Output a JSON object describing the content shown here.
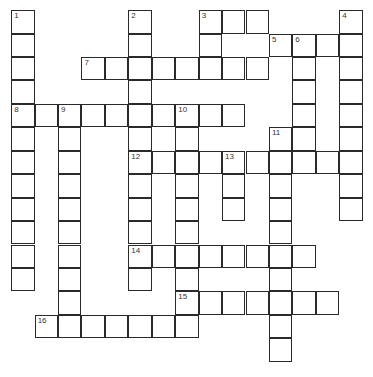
{
  "puzzle": {
    "rows": 15,
    "cols": 15,
    "cell_size": 23.43,
    "line_color": "#2a2a2a",
    "words": [
      {
        "number": 1,
        "direction": "down",
        "row": 0,
        "col": 0,
        "length": 12
      },
      {
        "number": 2,
        "direction": "down",
        "row": 0,
        "col": 5,
        "length": 12
      },
      {
        "number": 3,
        "direction": "across",
        "row": 0,
        "col": 8,
        "length": 3
      },
      {
        "number": 3,
        "direction": "down",
        "row": 0,
        "col": 8,
        "length": 3
      },
      {
        "number": 4,
        "direction": "down",
        "row": 0,
        "col": 14,
        "length": 9
      },
      {
        "number": 5,
        "direction": "across",
        "row": 1,
        "col": 11,
        "length": 4
      },
      {
        "number": 6,
        "direction": "down",
        "row": 1,
        "col": 12,
        "length": 5
      },
      {
        "number": 7,
        "direction": "across",
        "row": 2,
        "col": 3,
        "length": 8
      },
      {
        "number": 8,
        "direction": "across",
        "row": 4,
        "col": 0,
        "length": 10
      },
      {
        "number": 9,
        "direction": "down",
        "row": 4,
        "col": 2,
        "length": 10
      },
      {
        "number": 10,
        "direction": "down",
        "row": 4,
        "col": 7,
        "length": 10
      },
      {
        "number": 11,
        "direction": "down",
        "row": 5,
        "col": 11,
        "length": 10
      },
      {
        "number": 12,
        "direction": "across",
        "row": 6,
        "col": 5,
        "length": 10
      },
      {
        "number": 13,
        "direction": "down",
        "row": 6,
        "col": 9,
        "length": 3
      },
      {
        "number": 14,
        "direction": "across",
        "row": 10,
        "col": 5,
        "length": 8
      },
      {
        "number": 15,
        "direction": "across",
        "row": 12,
        "col": 7,
        "length": 7
      },
      {
        "number": 16,
        "direction": "across",
        "row": 13,
        "col": 1,
        "length": 7
      }
    ]
  }
}
